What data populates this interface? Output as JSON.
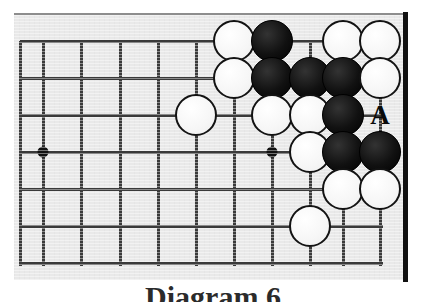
{
  "figure": {
    "kind": "go-board-diagram",
    "caption": "Diagram 6",
    "board_background_color": "#e9e9e9",
    "line_color": "#3a3a3a",
    "black_stone_color": "#141414",
    "white_stone_color": "#fbfbfb",
    "frame_color": "#111111"
  },
  "board": {
    "description": "Partial go board showing the upper-right corner region",
    "stone_radius_px": 21,
    "grid": {
      "x_positions": [
        20,
        43,
        81,
        120,
        158,
        196,
        234,
        272,
        310,
        343,
        380
      ],
      "y_positions": [
        41,
        78,
        115,
        152,
        189,
        226,
        263
      ],
      "spacing_px": 38,
      "columns": 11,
      "rows": 7
    },
    "star_points": [
      {
        "name": "hoshi-left",
        "x": 43,
        "y": 152
      },
      {
        "name": "hoshi-right",
        "x": 272,
        "y": 152
      }
    ],
    "stones": [
      {
        "color": "white",
        "x": 234,
        "y": 41,
        "label": "white-stone-r1c7"
      },
      {
        "color": "black",
        "x": 272,
        "y": 41,
        "label": "black-stone-r1c8"
      },
      {
        "color": "white",
        "x": 343,
        "y": 41,
        "label": "white-stone-r1c10"
      },
      {
        "color": "white",
        "x": 380,
        "y": 41,
        "label": "white-stone-r1c11"
      },
      {
        "color": "white",
        "x": 234,
        "y": 78,
        "label": "white-stone-r2c7"
      },
      {
        "color": "black",
        "x": 272,
        "y": 78,
        "label": "black-stone-r2c8"
      },
      {
        "color": "black",
        "x": 310,
        "y": 78,
        "label": "black-stone-r2c9"
      },
      {
        "color": "black",
        "x": 343,
        "y": 78,
        "label": "black-stone-r2c10"
      },
      {
        "color": "white",
        "x": 380,
        "y": 78,
        "label": "white-stone-r2c11"
      },
      {
        "color": "white",
        "x": 196,
        "y": 115,
        "label": "white-stone-r3c6"
      },
      {
        "color": "white",
        "x": 272,
        "y": 115,
        "label": "white-stone-r3c8"
      },
      {
        "color": "white",
        "x": 310,
        "y": 115,
        "label": "white-stone-r3c9"
      },
      {
        "color": "black",
        "x": 343,
        "y": 115,
        "label": "black-stone-r3c10"
      },
      {
        "color": "white",
        "x": 310,
        "y": 152,
        "label": "white-stone-r4c9"
      },
      {
        "color": "black",
        "x": 343,
        "y": 152,
        "label": "black-stone-r4c10"
      },
      {
        "color": "black",
        "x": 380,
        "y": 152,
        "label": "black-stone-r4c11"
      },
      {
        "color": "white",
        "x": 343,
        "y": 189,
        "label": "white-stone-r5c10"
      },
      {
        "color": "white",
        "x": 380,
        "y": 189,
        "label": "white-stone-r5c11"
      },
      {
        "color": "white",
        "x": 310,
        "y": 226,
        "label": "white-stone-r6c9"
      }
    ],
    "markers": [
      {
        "text": "A",
        "x": 380,
        "y": 115,
        "label": "point-marker-a"
      }
    ]
  }
}
